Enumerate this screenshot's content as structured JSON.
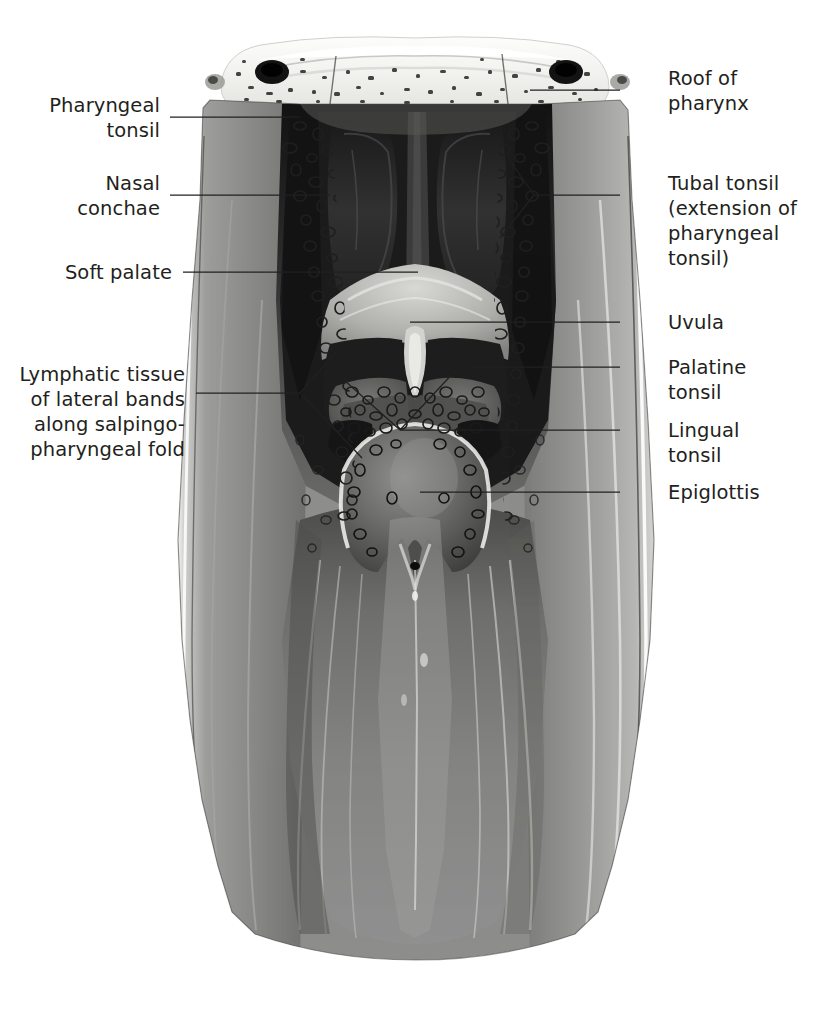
{
  "figure": {
    "view": "posterior coronal section of the pharynx, opened along the posterior wall",
    "style": "grayscale medical illustration",
    "colors": {
      "background": "#ffffff",
      "label_text": "#231f20",
      "leader_line": "#231f20",
      "bone_light": "#f4f4f2",
      "mucosa_mid": "#8d8d8d",
      "mucosa_light": "#c9c9c7",
      "cavity_dark": "#2b2b2b",
      "cavity_black": "#141414",
      "highlight": "#ffffff"
    }
  },
  "labels": {
    "roof_of_pharynx": {
      "text": "Roof of\npharynx",
      "side": "right",
      "text_x": 668,
      "text_y": 78,
      "leader": [
        [
          620,
          90
        ],
        [
          530,
          90
        ]
      ]
    },
    "pharyngeal_tonsil": {
      "text": "Pharyngeal\ntonsil",
      "side": "left",
      "text_right": 160,
      "text_y": 105,
      "leader": [
        [
          170,
          117
        ],
        [
          300,
          117
        ]
      ]
    },
    "nasal_conchae": {
      "text": "Nasal\nconchae",
      "side": "left",
      "text_right": 160,
      "text_y": 183,
      "leader": [
        [
          170,
          195
        ],
        [
          330,
          195
        ]
      ]
    },
    "tubal_tonsil": {
      "text": "Tubal tonsil\n(extension of\npharyngeal\ntonsil)",
      "side": "right",
      "text_x": 668,
      "text_y": 183,
      "leader": [
        [
          620,
          195
        ],
        [
          534,
          195
        ]
      ],
      "fork": [
        [
          534,
          195
        ],
        [
          508,
          160
        ],
        [
          534,
          195
        ],
        [
          500,
          235
        ]
      ]
    },
    "soft_palate": {
      "text": "Soft palate",
      "side": "left",
      "text_right": 172,
      "text_y": 260,
      "leader": [
        [
          183,
          272
        ],
        [
          418,
          272
        ]
      ]
    },
    "uvula": {
      "text": "Uvula",
      "side": "right",
      "text_x": 668,
      "text_y": 310,
      "leader": [
        [
          620,
          322
        ],
        [
          410,
          322
        ]
      ]
    },
    "palatine_tonsil": {
      "text": "Palatine\ntonsil",
      "side": "right",
      "text_x": 668,
      "text_y": 355,
      "leader": [
        [
          620,
          367
        ],
        [
          470,
          367
        ]
      ]
    },
    "lymphatic_tissue": {
      "text": "Lymphatic tissue\nof lateral bands\nalong salpingo-\npharyngeal fold",
      "side": "left",
      "text_right": 185,
      "text_y": 362,
      "leader": [
        [
          196,
          393
        ],
        [
          300,
          393
        ]
      ],
      "fork": [
        [
          300,
          393
        ],
        [
          338,
          350
        ],
        [
          300,
          393
        ],
        [
          360,
          455
        ]
      ]
    },
    "lingual_tonsil": {
      "text": "Lingual\ntonsil",
      "side": "right",
      "text_x": 668,
      "text_y": 418,
      "leader": [
        [
          620,
          430
        ],
        [
          400,
          430
        ]
      ],
      "fork": [
        [
          400,
          430
        ],
        [
          345,
          382
        ],
        [
          400,
          430
        ],
        [
          455,
          372
        ]
      ]
    },
    "epiglottis": {
      "text": "Epiglottis",
      "side": "right",
      "text_x": 668,
      "text_y": 480,
      "leader": [
        [
          620,
          492
        ],
        [
          420,
          492
        ]
      ]
    }
  },
  "anatomy_parts": [
    {
      "name": "skull-base-bone",
      "description": "cancellous bone of skull base with dark foramina, top of image"
    },
    {
      "name": "nasal-septum",
      "description": "central vertical dark band between nasal cavities"
    },
    {
      "name": "nasal-concha-left",
      "description": "dark lobed turbinate left of septum"
    },
    {
      "name": "nasal-concha-right",
      "description": "dark lobed turbinate right of septum"
    },
    {
      "name": "pharyngeal-tonsil-mass",
      "description": "follicular lymphoid tissue on roof of nasopharynx"
    },
    {
      "name": "soft-palate",
      "description": "pale arching shelf above the uvula"
    },
    {
      "name": "uvula",
      "description": "central pendulous projection below soft palate"
    },
    {
      "name": "palatine-tonsil-left",
      "description": "follicular mass lateral to uvula, left"
    },
    {
      "name": "palatine-tonsil-right",
      "description": "follicular mass lateral to uvula, right"
    },
    {
      "name": "lingual-tonsil",
      "description": "follicular tissue at tongue base behind epiglottis"
    },
    {
      "name": "epiglottis",
      "description": "oval leaf-shaped cartilage with median notch below"
    },
    {
      "name": "lateral-band-left",
      "description": "vertical column of lymphoid follicles on left lateral wall"
    },
    {
      "name": "lateral-band-right",
      "description": "vertical column of lymphoid follicles on right lateral wall"
    },
    {
      "name": "posterior-pharyngeal-wall",
      "description": "broad muscular wall filling lower half, tapering to arched cut edge"
    },
    {
      "name": "pharyngeal-constrictor-muscle",
      "description": "striated fanning muscle fibers on lateral walls"
    }
  ]
}
